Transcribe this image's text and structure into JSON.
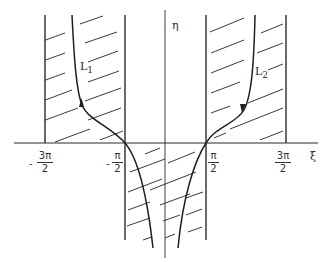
{
  "figure": {
    "axes": {
      "x_label": "ξ",
      "y_label": "η"
    },
    "ticks": [
      {
        "id": "neg-3pi-2",
        "sign": "-",
        "num": "3π",
        "den": "2"
      },
      {
        "id": "neg-pi-2",
        "sign": "-",
        "num": "π",
        "den": "2"
      },
      {
        "id": "pi-2",
        "sign": "",
        "num": "π",
        "den": "2"
      },
      {
        "id": "3pi-2",
        "sign": "",
        "num": "3π",
        "den": "2"
      }
    ],
    "curves": [
      {
        "id": "L1",
        "base": "L",
        "sub": "1"
      },
      {
        "id": "L2",
        "base": "L",
        "sub": "2"
      }
    ],
    "regions": [
      {
        "id": "upper-left-strip",
        "desc": "hatched strip between -3π/2 and -π/2, η > 0"
      },
      {
        "id": "upper-right-strip",
        "desc": "hatched strip between π/2 and 3π/2, η > 0"
      },
      {
        "id": "lower-center-strip",
        "desc": "hatched strip between -π/2 and π/2, η < 0"
      }
    ],
    "colors": {
      "ink": "#2a2a2a",
      "background": "#ffffff"
    }
  }
}
